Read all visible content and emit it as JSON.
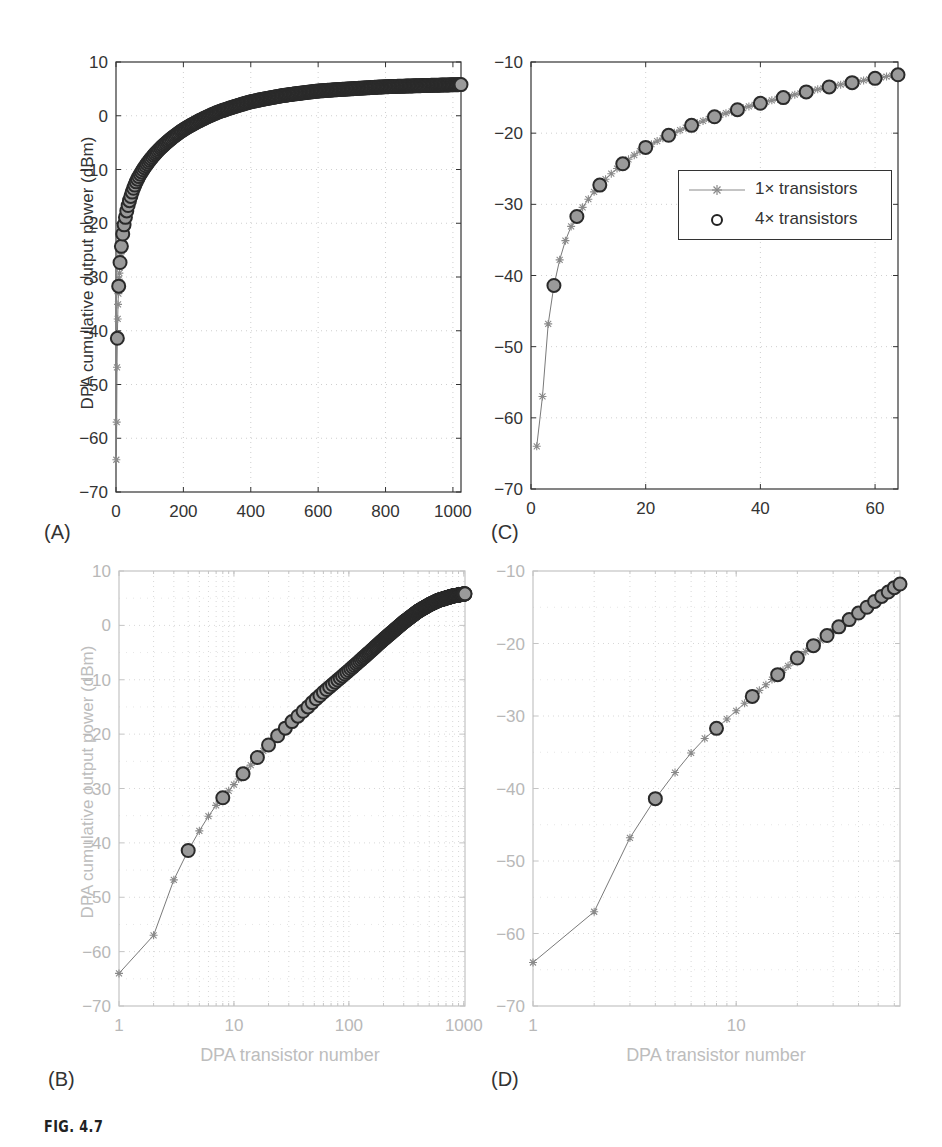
{
  "figure": {
    "caption": "FIG. 4.7",
    "panel_labels": [
      "(A)",
      "(B)",
      "(C)",
      "(D)"
    ],
    "legend": {
      "series1": "1× transistors",
      "series2": "4× transistors"
    }
  },
  "chart_data": [
    {
      "panel": "A",
      "type": "scatter",
      "title": "",
      "xlabel": "",
      "ylabel": "DPA cumulative output power (dBm)",
      "xscale": "linear",
      "xlim": [
        0,
        1024
      ],
      "ylim": [
        -70,
        10
      ],
      "xticks": [
        0,
        200,
        400,
        600,
        800,
        1000
      ],
      "xtick_labels": [
        "0",
        "200",
        "400",
        "600",
        "800",
        "1000"
      ],
      "yticks": [
        10,
        0,
        -10,
        -20,
        -30,
        -40,
        -50,
        -60,
        -70
      ],
      "ytick_labels": [
        "10",
        "0",
        "−10",
        "−20",
        "−30",
        "−40",
        "−50",
        "−60",
        "−70"
      ],
      "grid": true,
      "series": [
        {
          "name": "1× transistors",
          "marker": "*",
          "line": true,
          "step": 1,
          "n_range": [
            1,
            1024
          ]
        },
        {
          "name": "4× transistors",
          "marker": "o",
          "line": false,
          "step": 4,
          "n_range": [
            4,
            1024
          ]
        }
      ]
    },
    {
      "panel": "B",
      "type": "scatter",
      "title": "",
      "xlabel": "DPA transistor number",
      "ylabel": "DPA cumulative output power (dBm)",
      "xscale": "log",
      "xlim": [
        1,
        1024
      ],
      "ylim": [
        -70,
        10
      ],
      "xticks": [
        1,
        10,
        100,
        1000
      ],
      "xtick_labels": [
        "1",
        "10",
        "100",
        "1000"
      ],
      "yticks": [
        10,
        0,
        -10,
        -20,
        -30,
        -40,
        -50,
        -60,
        -70
      ],
      "ytick_labels": [
        "10",
        "0",
        "−10",
        "−20",
        "−30",
        "−40",
        "−50",
        "−60",
        "−70"
      ],
      "grid": true,
      "series": [
        {
          "name": "1× transistors",
          "marker": "*",
          "line": true,
          "step": 1,
          "n_range": [
            1,
            1024
          ]
        },
        {
          "name": "4× transistors",
          "marker": "o",
          "line": false,
          "step": 4,
          "n_range": [
            4,
            1024
          ]
        }
      ]
    },
    {
      "panel": "C",
      "type": "scatter",
      "title": "",
      "xlabel": "",
      "ylabel": "",
      "xscale": "linear",
      "xlim": [
        0,
        64
      ],
      "ylim": [
        -70,
        -10
      ],
      "xticks": [
        0,
        20,
        40,
        60
      ],
      "xtick_labels": [
        "0",
        "20",
        "40",
        "60"
      ],
      "yticks": [
        -10,
        -20,
        -30,
        -40,
        -50,
        -60,
        -70
      ],
      "ytick_labels": [
        "−10",
        "−20",
        "−30",
        "−40",
        "−50",
        "−60",
        "−70"
      ],
      "grid": true,
      "legend_position": "center-right",
      "series": [
        {
          "name": "1× transistors",
          "marker": "*",
          "line": true,
          "step": 1,
          "n_range": [
            1,
            64
          ]
        },
        {
          "name": "4× transistors",
          "marker": "o",
          "line": false,
          "step": 4,
          "n_range": [
            4,
            64
          ]
        }
      ]
    },
    {
      "panel": "D",
      "type": "scatter",
      "title": "",
      "xlabel": "DPA transistor number",
      "ylabel": "",
      "xscale": "log",
      "xlim": [
        1,
        64
      ],
      "ylim": [
        -70,
        -10
      ],
      "xticks": [
        1,
        10
      ],
      "xtick_labels": [
        "1",
        "10"
      ],
      "yticks": [
        -10,
        -20,
        -30,
        -40,
        -50,
        -60,
        -70
      ],
      "ytick_labels": [
        "−10",
        "−20",
        "−30",
        "−40",
        "−50",
        "−60",
        "−70"
      ],
      "grid": true,
      "series": [
        {
          "name": "1× transistors",
          "marker": "*",
          "line": true,
          "step": 1,
          "n_range": [
            1,
            64
          ]
        },
        {
          "name": "4× transistors",
          "marker": "o",
          "line": false,
          "step": 4,
          "n_range": [
            4,
            64
          ]
        }
      ]
    }
  ],
  "curve_anchor_points": {
    "n": [
      1,
      2,
      3,
      4,
      5,
      6,
      7,
      8,
      12,
      16,
      20,
      24,
      28,
      32,
      36,
      40,
      44,
      48,
      52,
      56,
      60,
      64,
      100,
      150,
      200,
      300,
      400,
      500,
      600,
      800,
      1024
    ],
    "dBm": [
      -64,
      -57,
      -46.8,
      -41.4,
      -37.8,
      -35.1,
      -33.1,
      -31.7,
      -27.3,
      -24.3,
      -22.0,
      -20.3,
      -18.9,
      -17.7,
      -16.7,
      -15.8,
      -15.0,
      -14.2,
      -13.5,
      -12.9,
      -12.3,
      -11.8,
      -8.3,
      -5.0,
      -2.6,
      0.6,
      2.6,
      3.8,
      4.6,
      5.4,
      5.8
    ]
  }
}
